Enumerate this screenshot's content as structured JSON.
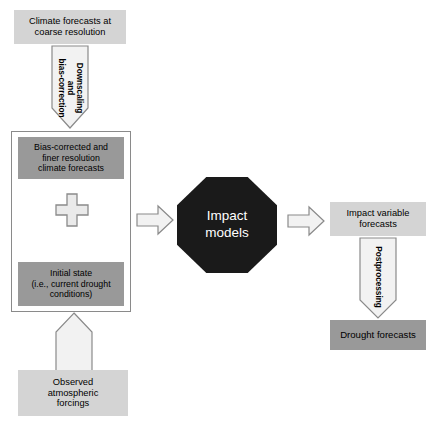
{
  "diagram": {
    "background_color": "#ffffff",
    "colors": {
      "box_light": "#d4d4d4",
      "box_dark": "#999999",
      "octagon_fill": "#1a1a1a",
      "octagon_text": "#ffffff",
      "arrow_fill": "#f2f2f2",
      "arrow_stroke": "#8a8a8a",
      "container_stroke": "#8a8a8a",
      "text": "#000000"
    }
  },
  "nodes": {
    "climate_forecasts_coarse": {
      "label": "Climate forecasts at\ncoarse resolution",
      "style": "box-light"
    },
    "bias_corrected_finer": {
      "label": "Bias-corrected and\nfiner resolution\nclimate forecasts",
      "style": "box-dark"
    },
    "initial_state": {
      "label": "Initial state\n(i.e., current drought\nconditions)",
      "style": "box-dark"
    },
    "observed_forcings": {
      "label": "Observed\natmospheric\nforcings",
      "style": "box-light"
    },
    "impact_models": {
      "label": "Impact\nmodels",
      "style": "octagon"
    },
    "impact_variable_forecasts": {
      "label": "Impact variable\nforecasts",
      "style": "box-light"
    },
    "drought_forecasts": {
      "label": "Drought forecasts",
      "style": "box-dark"
    }
  },
  "arrows": {
    "downscaling": {
      "label": "Downscaling\nand\nbias-correction",
      "direction": "down",
      "from": "climate_forecasts_coarse",
      "to": "bias_corrected_finer"
    },
    "forcings_up": {
      "label": "",
      "direction": "up",
      "from": "observed_forcings",
      "to": "initial_state"
    },
    "inputs_to_models": {
      "label": "",
      "direction": "right",
      "from": "container",
      "to": "impact_models"
    },
    "models_to_outputs": {
      "label": "",
      "direction": "right",
      "from": "impact_models",
      "to": "impact_variable_forecasts"
    },
    "postprocessing": {
      "label": "Postprocessing",
      "direction": "down",
      "from": "impact_variable_forecasts",
      "to": "drought_forecasts"
    }
  },
  "symbols": {
    "combine_plus": {
      "glyph": "plus",
      "meaning": "combination of climate forecasts and initial state"
    }
  }
}
